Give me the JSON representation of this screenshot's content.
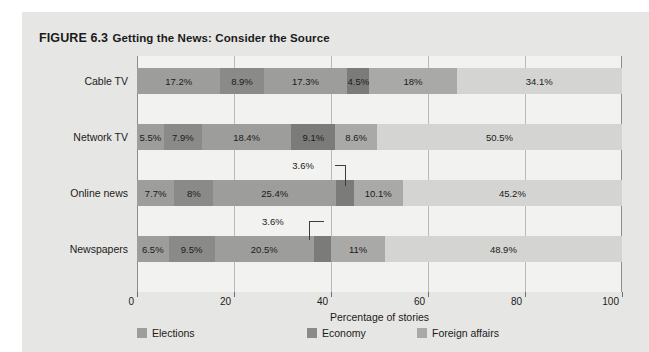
{
  "figure": {
    "number": "FIGURE 6.3",
    "title": "Getting the News: Consider the Source"
  },
  "chart_data": {
    "type": "bar",
    "orientation": "horizontal",
    "stacked": true,
    "title": "Getting the News: Consider the Source",
    "xlabel": "Percentage of stories",
    "ylabel": "",
    "xlim": [
      0,
      100
    ],
    "xticks": [
      0,
      20,
      40,
      60,
      80,
      100
    ],
    "xtick_labels": [
      "0",
      "20",
      "40",
      "60",
      "80",
      "100"
    ],
    "grid": true,
    "legend_position": "bottom",
    "categories": [
      "Cable TV",
      "Network TV",
      "Online news",
      "Newspapers"
    ],
    "series": [
      {
        "name": "Elections",
        "color": "#9d9d9b",
        "values": [
          17.2,
          5.5,
          7.7,
          6.5
        ]
      },
      {
        "name": "segment-2",
        "color": "#8a8a88",
        "values": [
          8.9,
          7.9,
          8.0,
          9.5
        ]
      },
      {
        "name": "Economy",
        "color": "#9d9d9b",
        "values": [
          17.3,
          18.4,
          25.4,
          20.5
        ]
      },
      {
        "name": "segment-4",
        "color": "#7b7b79",
        "values": [
          4.5,
          9.1,
          3.6,
          3.6
        ]
      },
      {
        "name": "Foreign affairs",
        "color": "#a9a9a7",
        "values": [
          18.0,
          8.6,
          10.1,
          11.0
        ]
      },
      {
        "name": "segment-6",
        "color": "#d4d4d2",
        "values": [
          34.1,
          50.5,
          45.2,
          48.9
        ]
      }
    ],
    "bar_labels": [
      [
        "17.2%",
        "8.9%",
        "17.3%",
        "4.5%",
        "18%",
        "34.1%"
      ],
      [
        "5.5%",
        "7.9%",
        "18.4%",
        "9.1%",
        "8.6%",
        "50.5%"
      ],
      [
        "7.7%",
        "8%",
        "25.4%",
        "3.6%",
        "10.1%",
        "45.2%"
      ],
      [
        "6.5%",
        "9.5%",
        "20.5%",
        "3.6%",
        "11%",
        "48.9%"
      ]
    ],
    "callouts": [
      {
        "row": "Online news",
        "label": "3.6%"
      },
      {
        "row": "Newspapers",
        "label": "3.6%"
      }
    ]
  },
  "rows": [
    {
      "label": "Cable TV",
      "segments": [
        {
          "value": 17.2,
          "label": "17.2%",
          "color": "#9d9d9b"
        },
        {
          "value": 8.9,
          "label": "8.9%",
          "color": "#8a8a88"
        },
        {
          "value": 17.3,
          "label": "17.3%",
          "color": "#9d9d9b"
        },
        {
          "value": 4.5,
          "label": "4.5%",
          "color": "#7b7b79"
        },
        {
          "value": 18.0,
          "label": "18%",
          "color": "#a9a9a7"
        },
        {
          "value": 34.1,
          "label": "34.1%",
          "color": "#d4d4d2"
        }
      ]
    },
    {
      "label": "Network TV",
      "segments": [
        {
          "value": 5.5,
          "label": "5.5%",
          "color": "#9d9d9b"
        },
        {
          "value": 7.9,
          "label": "7.9%",
          "color": "#8a8a88"
        },
        {
          "value": 18.4,
          "label": "18.4%",
          "color": "#9d9d9b"
        },
        {
          "value": 9.1,
          "label": "9.1%",
          "color": "#7b7b79"
        },
        {
          "value": 8.6,
          "label": "8.6%",
          "color": "#a9a9a7"
        },
        {
          "value": 50.5,
          "label": "50.5%",
          "color": "#d4d4d2"
        }
      ]
    },
    {
      "label": "Online news",
      "segments": [
        {
          "value": 7.7,
          "label": "7.7%",
          "color": "#9d9d9b"
        },
        {
          "value": 8.0,
          "label": "8%",
          "color": "#8a8a88"
        },
        {
          "value": 25.4,
          "label": "25.4%",
          "color": "#9d9d9b"
        },
        {
          "value": 3.6,
          "label": "3.6%",
          "color": "#7b7b79"
        },
        {
          "value": 10.1,
          "label": "10.1%",
          "color": "#a9a9a7"
        },
        {
          "value": 45.2,
          "label": "45.2%",
          "color": "#d4d4d2"
        }
      ]
    },
    {
      "label": "Newspapers",
      "segments": [
        {
          "value": 6.5,
          "label": "6.5%",
          "color": "#9d9d9b"
        },
        {
          "value": 9.5,
          "label": "9.5%",
          "color": "#8a8a88"
        },
        {
          "value": 20.5,
          "label": "20.5%",
          "color": "#9d9d9b"
        },
        {
          "value": 3.6,
          "label": "3.6%",
          "color": "#7b7b79"
        },
        {
          "value": 11.0,
          "label": "11%",
          "color": "#a9a9a7"
        },
        {
          "value": 48.9,
          "label": "48.9%",
          "color": "#d4d4d2"
        }
      ]
    }
  ],
  "axis": {
    "ticks": [
      "0",
      "20",
      "40",
      "60",
      "80",
      "100"
    ],
    "title": "Percentage of stories"
  },
  "legend": {
    "items": [
      {
        "label": "Elections",
        "color": "#9d9d9b"
      },
      {
        "label": "Economy",
        "color": "#8a8a88"
      },
      {
        "label": "Foreign affairs",
        "color": "#a9a9a7"
      }
    ]
  }
}
